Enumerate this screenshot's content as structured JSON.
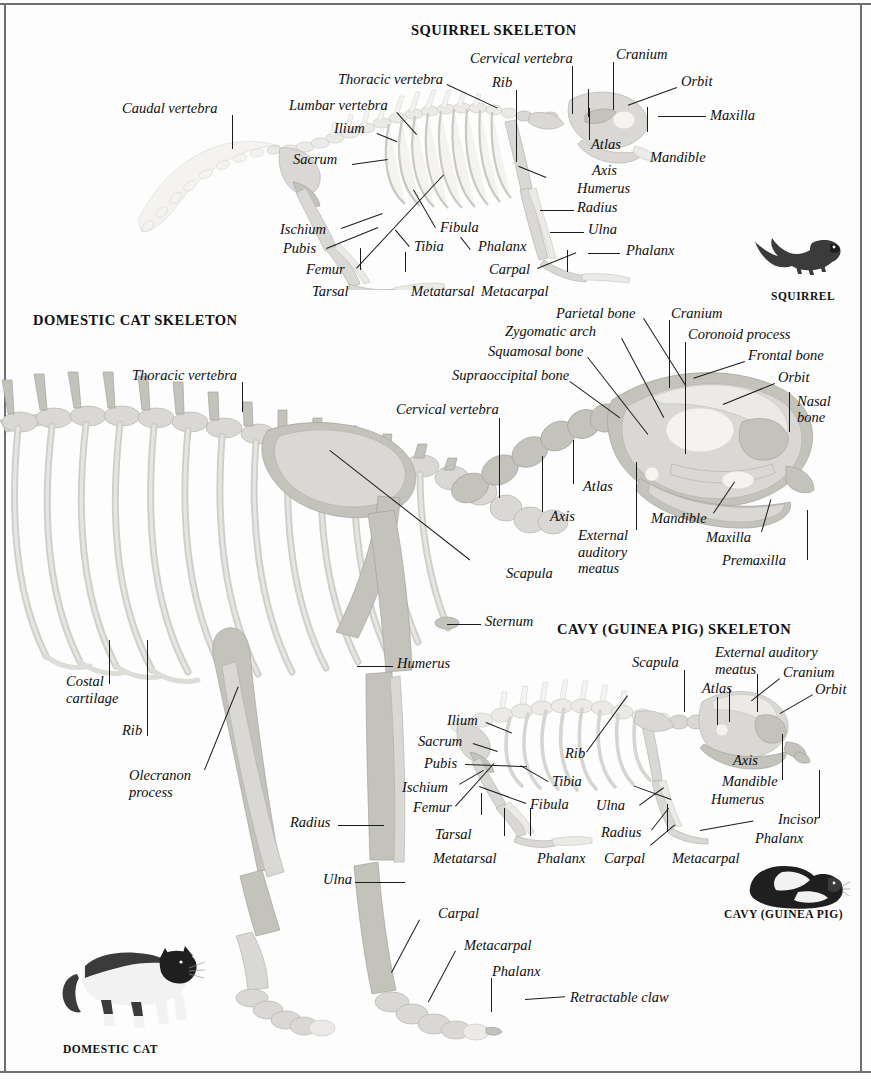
{
  "page": {
    "background_color": "#ffffff",
    "border_color": "#6f6f6f",
    "text_color": "#0d0d0d"
  },
  "sections": {
    "squirrel": {
      "title": "SQUIRREL SKELETON"
    },
    "cat": {
      "title": "DOMESTIC CAT SKELETON"
    },
    "cavy": {
      "title": "CAVY (GUINEA PIG) SKELETON"
    }
  },
  "captions": {
    "squirrel": "SQUIRREL",
    "cat": "DOMESTIC CAT",
    "cavy": "CAVY (GUINEA PIG)"
  },
  "squirrel_labels": [
    {
      "id": "caudal-vertebra",
      "text": "Caudal vertebra"
    },
    {
      "id": "thoracic-vertebra",
      "text": "Thoracic vertebra"
    },
    {
      "id": "cervical-vertebra",
      "text": "Cervical vertebra"
    },
    {
      "id": "rib",
      "text": "Rib"
    },
    {
      "id": "cranium",
      "text": "Cranium"
    },
    {
      "id": "orbit",
      "text": "Orbit"
    },
    {
      "id": "maxilla",
      "text": "Maxilla"
    },
    {
      "id": "mandible",
      "text": "Mandible"
    },
    {
      "id": "atlas",
      "text": "Atlas"
    },
    {
      "id": "axis",
      "text": "Axis"
    },
    {
      "id": "humerus",
      "text": "Humerus"
    },
    {
      "id": "radius",
      "text": "Radius"
    },
    {
      "id": "ulna",
      "text": "Ulna"
    },
    {
      "id": "lumbar-vertebra",
      "text": "Lumbar vertebra"
    },
    {
      "id": "ilium",
      "text": "Ilium"
    },
    {
      "id": "sacrum",
      "text": "Sacrum"
    },
    {
      "id": "ischium",
      "text": "Ischium"
    },
    {
      "id": "pubis",
      "text": "Pubis"
    },
    {
      "id": "femur",
      "text": "Femur"
    },
    {
      "id": "fibula",
      "text": "Fibula"
    },
    {
      "id": "tibia",
      "text": "Tibia"
    },
    {
      "id": "tarsal",
      "text": "Tarsal"
    },
    {
      "id": "metatarsal",
      "text": "Metatarsal"
    },
    {
      "id": "phalanx-hind",
      "text": "Phalanx"
    },
    {
      "id": "carpal",
      "text": "Carpal"
    },
    {
      "id": "metacarpal",
      "text": "Metacarpal"
    },
    {
      "id": "phalanx-fore",
      "text": "Phalanx"
    }
  ],
  "cat_labels": [
    {
      "id": "thoracic-vertebra",
      "text": "Thoracic vertebra"
    },
    {
      "id": "cervical-vertebra",
      "text": "Cervical vertebra"
    },
    {
      "id": "parietal-bone",
      "text": "Parietal bone"
    },
    {
      "id": "zygomatic-arch",
      "text": "Zygomatic arch"
    },
    {
      "id": "squamosal-bone",
      "text": "Squamosal bone"
    },
    {
      "id": "supraoccipital-bone",
      "text": "Supraoccipital bone"
    },
    {
      "id": "cranium",
      "text": "Cranium"
    },
    {
      "id": "coronoid-process",
      "text": "Coronoid process"
    },
    {
      "id": "frontal-bone",
      "text": "Frontal bone"
    },
    {
      "id": "orbit",
      "text": "Orbit"
    },
    {
      "id": "nasal-bone",
      "text": "Nasal\nbone"
    },
    {
      "id": "atlas",
      "text": "Atlas"
    },
    {
      "id": "axis",
      "text": "Axis"
    },
    {
      "id": "external-auditory-meatus",
      "text": "External\nauditory\nmeatus"
    },
    {
      "id": "mandible",
      "text": "Mandible"
    },
    {
      "id": "maxilla",
      "text": "Maxilla"
    },
    {
      "id": "premaxilla",
      "text": "Premaxilla"
    },
    {
      "id": "scapula",
      "text": "Scapula"
    },
    {
      "id": "sternum",
      "text": "Sternum"
    },
    {
      "id": "humerus",
      "text": "Humerus"
    },
    {
      "id": "costal-cartilage",
      "text": "Costal\ncartilage"
    },
    {
      "id": "rib",
      "text": "Rib"
    },
    {
      "id": "olecranon-process",
      "text": "Olecranon\nprocess"
    },
    {
      "id": "radius",
      "text": "Radius"
    },
    {
      "id": "ulna",
      "text": "Ulna"
    },
    {
      "id": "carpal",
      "text": "Carpal"
    },
    {
      "id": "metacarpal",
      "text": "Metacarpal"
    },
    {
      "id": "phalanx",
      "text": "Phalanx"
    },
    {
      "id": "retractable-claw",
      "text": "Retractable claw"
    }
  ],
  "cavy_labels": [
    {
      "id": "scapula",
      "text": "Scapula"
    },
    {
      "id": "external-auditory-meatus",
      "text": "External auditory\nmeatus"
    },
    {
      "id": "cranium",
      "text": "Cranium"
    },
    {
      "id": "orbit",
      "text": "Orbit"
    },
    {
      "id": "atlas",
      "text": "Atlas"
    },
    {
      "id": "axis",
      "text": "Axis"
    },
    {
      "id": "mandible",
      "text": "Mandible"
    },
    {
      "id": "incisor",
      "text": "Incisor"
    },
    {
      "id": "humerus",
      "text": "Humerus"
    },
    {
      "id": "phalanx-fore",
      "text": "Phalanx"
    },
    {
      "id": "metacarpal",
      "text": "Metacarpal"
    },
    {
      "id": "carpal",
      "text": "Carpal"
    },
    {
      "id": "radius",
      "text": "Radius"
    },
    {
      "id": "ulna",
      "text": "Ulna"
    },
    {
      "id": "rib",
      "text": "Rib"
    },
    {
      "id": "ilium",
      "text": "Ilium"
    },
    {
      "id": "sacrum",
      "text": "Sacrum"
    },
    {
      "id": "pubis",
      "text": "Pubis"
    },
    {
      "id": "ischium",
      "text": "Ischium"
    },
    {
      "id": "femur",
      "text": "Femur"
    },
    {
      "id": "tibia",
      "text": "Tibia"
    },
    {
      "id": "fibula",
      "text": "Fibula"
    },
    {
      "id": "tarsal",
      "text": "Tarsal"
    },
    {
      "id": "metatarsal",
      "text": "Metatarsal"
    },
    {
      "id": "phalanx-hind",
      "text": "Phalanx"
    }
  ]
}
